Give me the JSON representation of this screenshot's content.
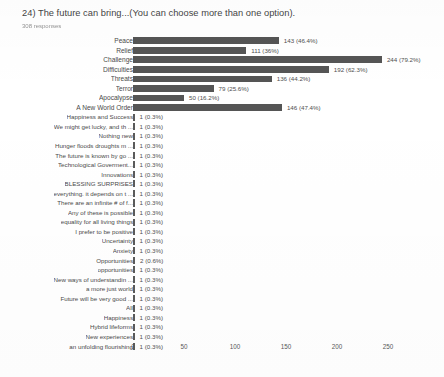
{
  "header": {
    "question_title": "24) The future can bring...(You can choose more than one option).",
    "response_count": "308 responses"
  },
  "axis": {
    "ticks": [
      "0",
      "50",
      "100",
      "150",
      "200",
      "250"
    ]
  },
  "chart_data": {
    "type": "bar",
    "orientation": "horizontal",
    "title": "24) The future can bring...(You can choose more than one option).",
    "subtitle": "308 responses",
    "xlabel": "",
    "ylabel": "",
    "xlim": [
      0,
      250
    ],
    "grid": false,
    "legend": "none",
    "bar_color": "#555555",
    "total_responses": 308,
    "categories": [
      "Peace",
      "Relief",
      "Challenge",
      "Difficulties",
      "Threats",
      "Terror",
      "Apocalypse",
      "A New World Order",
      "Happiness and Success",
      "We might get lucky, and th ...",
      "Nothing new",
      "Hunger floods droughts m ...",
      "The future is known by go ...",
      "Technological Goverment...",
      "Innovations",
      "BLESSING SURPRISES",
      "everything. it depends on t ...",
      "There are an infinite # of f...",
      "Any of these is possible",
      "equality for all living things",
      "I prefer to be positive",
      "Uncertainty",
      "Anxiety",
      "Opportunities",
      "opportunities",
      "New ways of understandin ...",
      "a more just world",
      "Future will be very good ...",
      "All",
      "Happiness",
      "Hybrid lifeforms",
      "New experiences",
      "an unfolding flourishing"
    ],
    "values": [
      143,
      111,
      244,
      192,
      136,
      79,
      50,
      146,
      1,
      1,
      1,
      1,
      1,
      1,
      1,
      1,
      1,
      1,
      1,
      1,
      1,
      1,
      1,
      2,
      1,
      1,
      1,
      1,
      1,
      1,
      1,
      1,
      1
    ],
    "value_labels": [
      "143 (46.4%)",
      "111 (36%)",
      "244 (79.2%)",
      "192 (62.3%)",
      "136 (44.2%)",
      "79 (25.6%)",
      "50 (16.2%)",
      "146 (47.4%)",
      "1 (0.3%)",
      "1 (0.3%)",
      "1 (0.3%)",
      "1 (0.3%)",
      "1 (0.3%)",
      "1 (0.3%)",
      "1 (0.3%)",
      "1 (0.3%)",
      "1 (0.3%)",
      "1 (0.3%)",
      "1 (0.3%)",
      "1 (0.3%)",
      "1 (0.3%)",
      "1 (0.3%)",
      "1 (0.3%)",
      "2 (0.6%)",
      "1 (0.3%)",
      "1 (0.3%)",
      "1 (0.3%)",
      "1 (0.3%)",
      "1 (0.3%)",
      "1 (0.3%)",
      "1 (0.3%)",
      "1 (0.3%)",
      "1 (0.3%)"
    ]
  }
}
